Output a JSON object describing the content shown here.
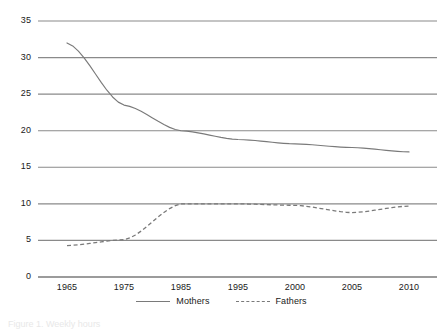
{
  "chart_data": {
    "type": "line",
    "title": "",
    "subtitle": "",
    "xlabel": "",
    "ylabel": "",
    "x": [
      "1965",
      "1975",
      "1985",
      "1995",
      "2000",
      "2005",
      "2010"
    ],
    "categories": [
      "1965",
      "1975",
      "1985",
      "1995",
      "2000",
      "2005",
      "2010"
    ],
    "series": [
      {
        "name": "Mothers",
        "style": "solid",
        "color": "#7a7a7a",
        "values": [
          32.0,
          23.5,
          20.0,
          18.8,
          18.2,
          17.7,
          17.1
        ]
      },
      {
        "name": "Fathers",
        "style": "dashed",
        "color": "#7a7a7a",
        "values": [
          4.3,
          5.1,
          10.0,
          10.0,
          9.8,
          8.8,
          9.7
        ]
      }
    ],
    "ylim": [
      0,
      35
    ],
    "yticks": [
      0,
      5,
      10,
      15,
      20,
      25,
      30,
      35
    ],
    "ytick_labels": [
      "0",
      "5",
      "10",
      "15",
      "20",
      "25",
      "30",
      "35"
    ],
    "grid": true,
    "grid_axis": "y",
    "legend_position": "bottom",
    "legend_entries": [
      "Mothers",
      "Fathers"
    ],
    "axis_color": "#7a7a7a",
    "grid_color": "#8a8a8a",
    "background": "#ffffff"
  },
  "caption": {
    "text": "Figure 1. Weekly hours"
  }
}
